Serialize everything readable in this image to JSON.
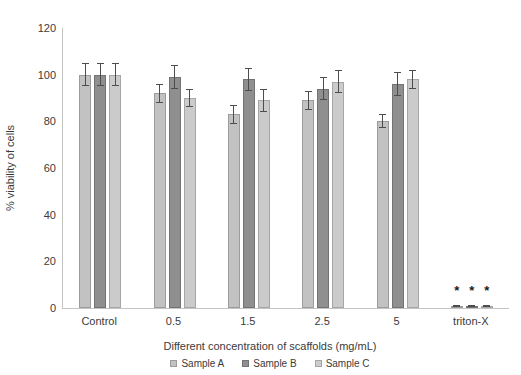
{
  "chart_data": {
    "type": "bar",
    "title": "",
    "categories": [
      "Control",
      "0.5",
      "1.5",
      "2.5",
      "5",
      "triton-X"
    ],
    "series": [
      {
        "name": "Sample A",
        "color": "#c2c2c2",
        "border_color": "#9c9c9c",
        "values": [
          100,
          92,
          83,
          89,
          80,
          1
        ],
        "errors": [
          5,
          4,
          4,
          4,
          3,
          0.5
        ]
      },
      {
        "name": "Sample B",
        "color": "#8f8f8f",
        "border_color": "#737373",
        "values": [
          100,
          99,
          98,
          94,
          96,
          1
        ],
        "errors": [
          5,
          5,
          5,
          5,
          5,
          0.5
        ]
      },
      {
        "name": "Sample C",
        "color": "#cbcbcb",
        "border_color": "#a6a6a6",
        "values": [
          100,
          90,
          89,
          97,
          98,
          1
        ],
        "errors": [
          5,
          4,
          5,
          5,
          4,
          0.5
        ]
      }
    ],
    "xlabel": "Different concentration of scaffolds (mg/mL)",
    "ylabel": "% viability of cells",
    "ylim": [
      0,
      120
    ],
    "ytick_step": 20,
    "grid": false,
    "legend_position": "bottom",
    "annotations": [
      {
        "symbol": "*",
        "category_index": 5,
        "series_index": 0,
        "y_value": 7
      },
      {
        "symbol": "*",
        "category_index": 5,
        "series_index": 1,
        "y_value": 7
      },
      {
        "symbol": "*",
        "category_index": 5,
        "series_index": 2,
        "y_value": 7
      }
    ],
    "colors": {
      "axis": "#c4c4c4",
      "text": "#3b3b3b",
      "error_bar": "#4d4d4d",
      "annotation": "#1a1a1a",
      "background": "#ffffff"
    }
  }
}
